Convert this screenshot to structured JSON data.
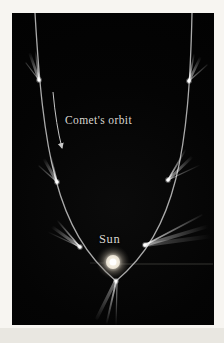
{
  "figure": {
    "type": "astronomy-diagram",
    "labels": {
      "orbit_label": "Comet's orbit",
      "sun_label": "Sun"
    },
    "colors": {
      "page": "#f7f5f1",
      "figure_background": "#040404",
      "orbit_line": "#bcbcbc",
      "text": "#d9d6d0",
      "sun_core": "#ffffff",
      "sun_glow": "#e8dfcf",
      "arrow": "#c6c6c6"
    },
    "elements": {
      "comet_count": 7,
      "tail_direction": "away from the Sun",
      "orbit_shape": "parabola opening upward with Sun near vertex"
    }
  }
}
